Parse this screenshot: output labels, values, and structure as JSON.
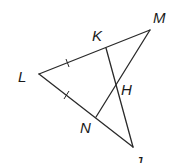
{
  "diagram": {
    "type": "geometry-figure",
    "points": {
      "L": "L",
      "K": "K",
      "M": "M",
      "H": "H",
      "N": "N",
      "J": "J"
    },
    "segments": [
      "LM",
      "LJ",
      "KJ",
      "MN"
    ],
    "congruence_marks": [
      "LK",
      "LN"
    ],
    "intersection": {
      "point": "H",
      "of": [
        "KJ",
        "MN"
      ]
    }
  }
}
